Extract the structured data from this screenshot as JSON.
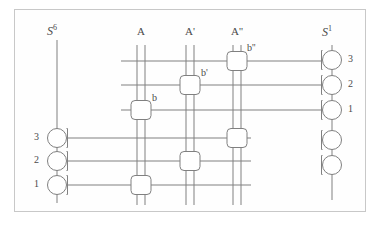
{
  "figure": {
    "background": "#ffffff",
    "frame_color": "#c8c8c8",
    "ink_color": "#808080",
    "text_color": "#4a4a4a"
  },
  "rails": {
    "left": {
      "name": "S",
      "superscript": "6",
      "label_full": "S6",
      "x": 57,
      "top_y": 40,
      "bottom_y": 203,
      "nodes": [
        {
          "label": "3",
          "cy": 138,
          "labeled": true
        },
        {
          "label": "2",
          "cy": 161,
          "labeled": true
        },
        {
          "label": "1",
          "cy": 185,
          "labeled": true
        }
      ]
    },
    "right": {
      "name": "S",
      "superscript": "1",
      "label_full": "S1",
      "x": 332,
      "top_y": 45,
      "bottom_y": 200,
      "nodes": [
        {
          "label": "3",
          "cy": 60,
          "labeled": true
        },
        {
          "label": "2",
          "cy": 85,
          "labeled": true
        },
        {
          "label": "1",
          "cy": 110,
          "labeled": true
        },
        {
          "label": "",
          "cy": 140,
          "labeled": false
        },
        {
          "label": "",
          "cy": 165,
          "labeled": false
        }
      ]
    }
  },
  "columns": [
    {
      "id": "A",
      "label": "A",
      "x": 141,
      "top_y": 45,
      "bottom_y": 205
    },
    {
      "id": "Ap",
      "label": "A'",
      "x": 190,
      "top_y": 45,
      "bottom_y": 205
    },
    {
      "id": "App",
      "label": "A''",
      "x": 237,
      "top_y": 45,
      "bottom_y": 205
    }
  ],
  "gates": [
    {
      "id": "b2",
      "label": "b''",
      "column": "App",
      "cy": 61,
      "labeled": true
    },
    {
      "id": "b1",
      "label": "b'",
      "column": "Ap",
      "cy": 85,
      "labeled": true
    },
    {
      "id": "b0",
      "label": "b",
      "column": "A",
      "cy": 110,
      "labeled": true
    },
    {
      "id": "g3",
      "label": "",
      "column": "App",
      "cy": 138,
      "labeled": false
    },
    {
      "id": "g2",
      "label": "",
      "column": "Ap",
      "cy": 161,
      "labeled": false
    },
    {
      "id": "g1",
      "label": "",
      "column": "A",
      "cy": 185,
      "labeled": false
    }
  ],
  "connectors": [
    {
      "id": "w3",
      "from": "column-App-gate-b2",
      "to": "right-node-3",
      "y": 61,
      "x1": 121,
      "x2": 322
    },
    {
      "id": "w2",
      "from": "column-Ap-gate-b1",
      "to": "right-node-2",
      "y": 85,
      "x1": 121,
      "x2": 322
    },
    {
      "id": "w1",
      "from": "column-A-gate-b0",
      "to": "right-node-1",
      "y": 110,
      "x1": 121,
      "x2": 322
    },
    {
      "id": "w6",
      "from": "left-node-3",
      "to": "column-App-gate-g3",
      "y": 138,
      "x1": 67,
      "x2": 251
    },
    {
      "id": "w5",
      "from": "left-node-2",
      "to": "column-Ap-gate-g2",
      "y": 161,
      "x1": 67,
      "x2": 251
    },
    {
      "id": "w4",
      "from": "left-node-1",
      "to": "column-A-gate-g1",
      "y": 185,
      "x1": 67,
      "x2": 251
    }
  ],
  "legend": {
    "column_labels": [
      "A",
      "A'",
      "A''"
    ],
    "gate_labels": [
      "b",
      "b'",
      "b''"
    ],
    "left_node_labels": [
      "3",
      "2",
      "1"
    ],
    "right_node_labels": [
      "3",
      "2",
      "1"
    ]
  }
}
